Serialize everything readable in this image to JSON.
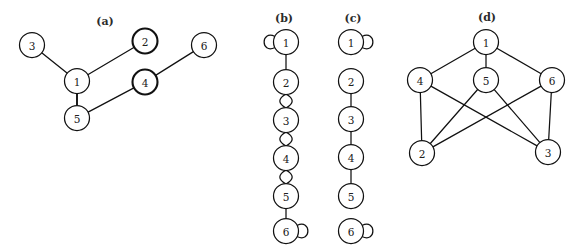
{
  "figure": {
    "width": 582,
    "height": 250,
    "background": "#ffffff",
    "stroke_color": "#111111",
    "node_fill": "#ffffff",
    "node_radius": 12.5
  },
  "panels": [
    {
      "id": "a",
      "caption": "(a)",
      "caption_pos": {
        "x": 105,
        "y": 25
      },
      "type": "undirected-graph",
      "nodes": [
        {
          "id": "3",
          "label": "3",
          "x": 32,
          "y": 45,
          "emphasis": false
        },
        {
          "id": "1",
          "label": "1",
          "x": 77,
          "y": 81,
          "emphasis": false
        },
        {
          "id": "2",
          "label": "2",
          "x": 145,
          "y": 41,
          "emphasis": true
        },
        {
          "id": "6",
          "label": "6",
          "x": 204,
          "y": 45,
          "emphasis": false
        },
        {
          "id": "4",
          "label": "4",
          "x": 145,
          "y": 82,
          "emphasis": true
        },
        {
          "id": "5",
          "label": "5",
          "x": 77,
          "y": 118,
          "emphasis": false
        }
      ],
      "edges": [
        {
          "from": "3",
          "to": "1",
          "kind": "line",
          "thick": false
        },
        {
          "from": "1",
          "to": "2",
          "kind": "line",
          "thick": false
        },
        {
          "from": "1",
          "to": "5",
          "kind": "line",
          "thick": true
        },
        {
          "from": "5",
          "to": "4",
          "kind": "line",
          "thick": false
        },
        {
          "from": "4",
          "to": "6",
          "kind": "line",
          "thick": false
        }
      ],
      "self_loops": []
    },
    {
      "id": "b",
      "caption": "(b)",
      "caption_pos": {
        "x": 284,
        "y": 22
      },
      "type": "undirected-graph",
      "nodes": [
        {
          "id": "1",
          "label": "1",
          "x": 286,
          "y": 42,
          "emphasis": false
        },
        {
          "id": "2",
          "label": "2",
          "x": 286,
          "y": 82,
          "emphasis": false
        },
        {
          "id": "3",
          "label": "3",
          "x": 286,
          "y": 120,
          "emphasis": false
        },
        {
          "id": "4",
          "label": "4",
          "x": 286,
          "y": 158,
          "emphasis": false
        },
        {
          "id": "5",
          "label": "5",
          "x": 286,
          "y": 196,
          "emphasis": false
        },
        {
          "id": "6",
          "label": "6",
          "x": 286,
          "y": 231,
          "emphasis": false
        }
      ],
      "edges": [
        {
          "from": "1",
          "to": "2",
          "kind": "line",
          "thick": false
        },
        {
          "from": "2",
          "to": "3",
          "kind": "double-arc",
          "thick": false
        },
        {
          "from": "3",
          "to": "4",
          "kind": "double-arc",
          "thick": false
        },
        {
          "from": "4",
          "to": "5",
          "kind": "double-arc",
          "thick": false
        },
        {
          "from": "5",
          "to": "6",
          "kind": "line",
          "thick": false
        }
      ],
      "self_loops": [
        {
          "node": "1",
          "side": "left"
        },
        {
          "node": "6",
          "side": "right"
        }
      ]
    },
    {
      "id": "c",
      "caption": "(c)",
      "caption_pos": {
        "x": 353,
        "y": 22
      },
      "type": "undirected-graph",
      "nodes": [
        {
          "id": "1",
          "label": "1",
          "x": 351,
          "y": 42,
          "emphasis": false
        },
        {
          "id": "2",
          "label": "2",
          "x": 351,
          "y": 81,
          "emphasis": false
        },
        {
          "id": "3",
          "label": "3",
          "x": 351,
          "y": 119,
          "emphasis": false
        },
        {
          "id": "4",
          "label": "4",
          "x": 351,
          "y": 157,
          "emphasis": false
        },
        {
          "id": "5",
          "label": "5",
          "x": 351,
          "y": 196,
          "emphasis": false
        },
        {
          "id": "6",
          "label": "6",
          "x": 351,
          "y": 231,
          "emphasis": false
        }
      ],
      "edges": [
        {
          "from": "2",
          "to": "3",
          "kind": "line",
          "thick": false
        },
        {
          "from": "3",
          "to": "4",
          "kind": "line",
          "thick": false
        },
        {
          "from": "4",
          "to": "5",
          "kind": "line",
          "thick": false
        }
      ],
      "self_loops": [
        {
          "node": "1",
          "side": "right"
        },
        {
          "node": "6",
          "side": "right"
        }
      ]
    },
    {
      "id": "d",
      "caption": "(d)",
      "caption_pos": {
        "x": 487,
        "y": 21
      },
      "type": "undirected-graph",
      "nodes": [
        {
          "id": "1",
          "label": "1",
          "x": 486,
          "y": 42,
          "emphasis": false
        },
        {
          "id": "4",
          "label": "4",
          "x": 420,
          "y": 80,
          "emphasis": false
        },
        {
          "id": "5",
          "label": "5",
          "x": 486,
          "y": 80,
          "emphasis": false
        },
        {
          "id": "6",
          "label": "6",
          "x": 552,
          "y": 80,
          "emphasis": false
        },
        {
          "id": "2",
          "label": "2",
          "x": 422,
          "y": 153,
          "emphasis": false
        },
        {
          "id": "3",
          "label": "3",
          "x": 548,
          "y": 152,
          "emphasis": false
        }
      ],
      "edges": [
        {
          "from": "1",
          "to": "4",
          "kind": "line",
          "thick": false
        },
        {
          "from": "1",
          "to": "5",
          "kind": "line",
          "thick": false
        },
        {
          "from": "1",
          "to": "6",
          "kind": "line",
          "thick": false
        },
        {
          "from": "4",
          "to": "2",
          "kind": "line",
          "thick": false
        },
        {
          "from": "4",
          "to": "3",
          "kind": "line",
          "thick": false
        },
        {
          "from": "5",
          "to": "2",
          "kind": "line",
          "thick": false
        },
        {
          "from": "5",
          "to": "3",
          "kind": "line",
          "thick": false
        },
        {
          "from": "6",
          "to": "2",
          "kind": "line",
          "thick": false
        },
        {
          "from": "6",
          "to": "3",
          "kind": "line",
          "thick": false
        }
      ],
      "self_loops": []
    }
  ]
}
